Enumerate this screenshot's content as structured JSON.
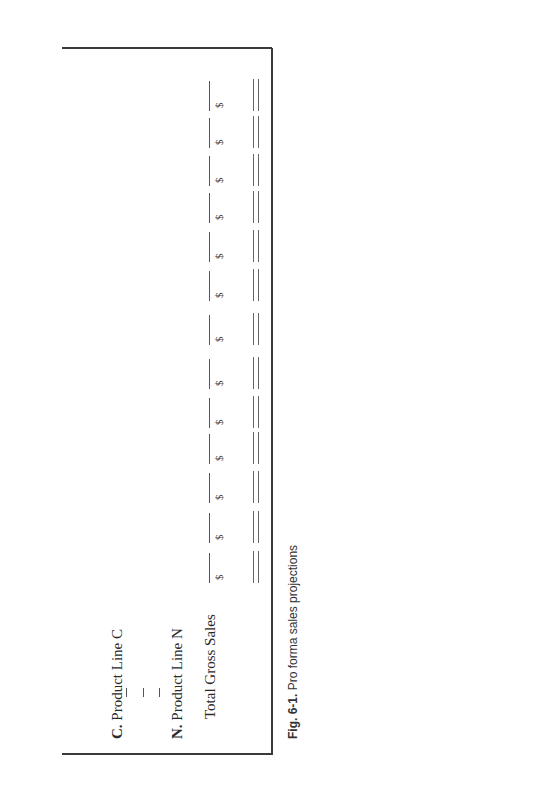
{
  "figure": {
    "caption_label": "Fig. 6-1.",
    "caption_text": "Pro forma sales projections"
  },
  "rows": [
    {
      "letter": "C.",
      "label": "Product Line C"
    },
    {
      "letter": "N.",
      "label": "Product Line N"
    }
  ],
  "ellipsis_marks": [
    "|",
    "|",
    "|"
  ],
  "total": {
    "label": "Total Gross Sales",
    "currency_symbol": "$",
    "column_count": 13,
    "columns": [
      "$",
      "$",
      "$",
      "$",
      "$",
      "$",
      "$",
      "$",
      "$",
      "$",
      "$",
      "$",
      "$"
    ]
  }
}
